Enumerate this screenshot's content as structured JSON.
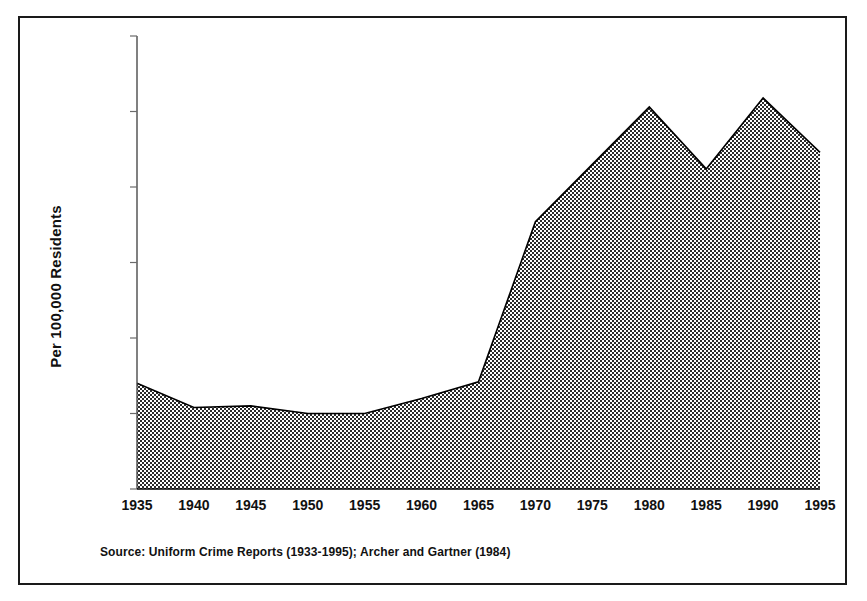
{
  "figure": {
    "source_note": "Source:  Uniform Crime Reports (1933-1995);  Archer and Gartner (1984)",
    "frame_color": "#1a1a1a",
    "fill_color": "#8c8c8c",
    "line_color": "#000000",
    "background": "#ffffff"
  },
  "chart_data": {
    "type": "area",
    "title": "",
    "subtitle": "",
    "xlabel": "",
    "ylabel": "Per 100,000 Residents",
    "x": [
      1935,
      1940,
      1945,
      1950,
      1955,
      1960,
      1965,
      1970,
      1975,
      1980,
      1985,
      1990,
      1995
    ],
    "values": [
      70,
      54,
      55,
      50,
      50,
      60,
      71,
      177,
      215,
      253,
      212,
      259,
      223
    ],
    "series": [
      {
        "name": "Rate per 100,000 Residents",
        "values": [
          70,
          54,
          55,
          50,
          50,
          60,
          71,
          177,
          215,
          253,
          212,
          259,
          223
        ]
      }
    ],
    "xlim": [
      1935,
      1995
    ],
    "ylim": [
      0,
      300
    ],
    "ytick_values": [
      0,
      50,
      100,
      150,
      200,
      250,
      300
    ],
    "ytick_labels": [
      "0",
      "50",
      "100",
      "150",
      "200",
      "250",
      "300"
    ],
    "xtick_values": [
      1935,
      1940,
      1945,
      1950,
      1955,
      1960,
      1965,
      1970,
      1975,
      1980,
      1985,
      1990,
      1995
    ],
    "xtick_labels": [
      "1935",
      "1940",
      "1945",
      "1950",
      "1955",
      "1960",
      "1965",
      "1970",
      "1975",
      "1980",
      "1985",
      "1990",
      "1995"
    ],
    "grid": false,
    "legend": false,
    "legend_position": "none",
    "fill_pattern": "checkerboard-dither"
  }
}
